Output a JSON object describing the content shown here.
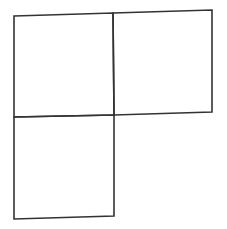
{
  "diagram": {
    "stroke_color": "#333333",
    "stroke_width": 1.6,
    "background": "#ffffff",
    "shapes": [
      {
        "name": "square-top-left",
        "points": [
          [
            14,
            16
          ],
          [
            113,
            13
          ],
          [
            114,
            115
          ],
          [
            14,
            117
          ]
        ]
      },
      {
        "name": "square-top-right",
        "points": [
          [
            113,
            13
          ],
          [
            212,
            10
          ],
          [
            212,
            112
          ],
          [
            114,
            115
          ]
        ]
      },
      {
        "name": "square-bottom-left",
        "points": [
          [
            14,
            117
          ],
          [
            114,
            115
          ],
          [
            114,
            216
          ],
          [
            14,
            219
          ]
        ]
      }
    ]
  }
}
